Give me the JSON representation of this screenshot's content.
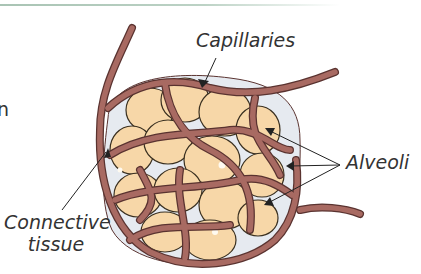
{
  "figure": {
    "labels": {
      "capillaries": "Capillaries",
      "alveoli": "Alveoli",
      "connective_line1": "Connective",
      "connective_line2": "tissue"
    },
    "left_text_fragment": "n"
  },
  "colors": {
    "vessel": "#a86a62",
    "vessel_outline": "#5a3330",
    "alveolus": "#f7d7a8",
    "alveolus_outline": "#3a3020",
    "connective": "#e6eaf0",
    "arrow": "#222222",
    "top_rule": "#a9c4b4"
  }
}
